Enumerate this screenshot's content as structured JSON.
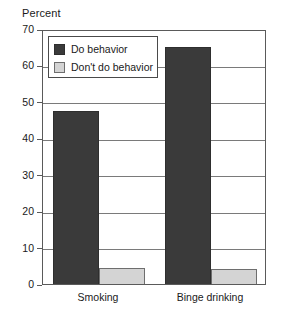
{
  "chart_data": {
    "type": "bar",
    "title": "",
    "subtitle": "",
    "xlabel": "",
    "ylabel": "Percent",
    "ylim": [
      0,
      70
    ],
    "yticks": [
      0,
      10,
      20,
      30,
      40,
      50,
      60,
      70
    ],
    "ytick_labels": [
      "0",
      "10",
      "20",
      "30",
      "40",
      "50",
      "60",
      "70"
    ],
    "grid": true,
    "grid_axis": "y",
    "legend_position": "top-left",
    "categories": [
      "Smoking",
      "Binge drinking"
    ],
    "series": [
      {
        "name": "Do behavior",
        "color": "#3a3a3a",
        "values": [
          48,
          65.5
        ]
      },
      {
        "name": "Don't do behavior",
        "color": "#d4d4d4",
        "values": [
          5,
          4.7
        ]
      }
    ],
    "annotations": []
  },
  "legend": {
    "items": [
      {
        "label": "Do behavior",
        "swatch": "dark"
      },
      {
        "label": "Don't do behavior",
        "swatch": "light"
      }
    ]
  },
  "axis": {
    "y_title": "Percent"
  }
}
